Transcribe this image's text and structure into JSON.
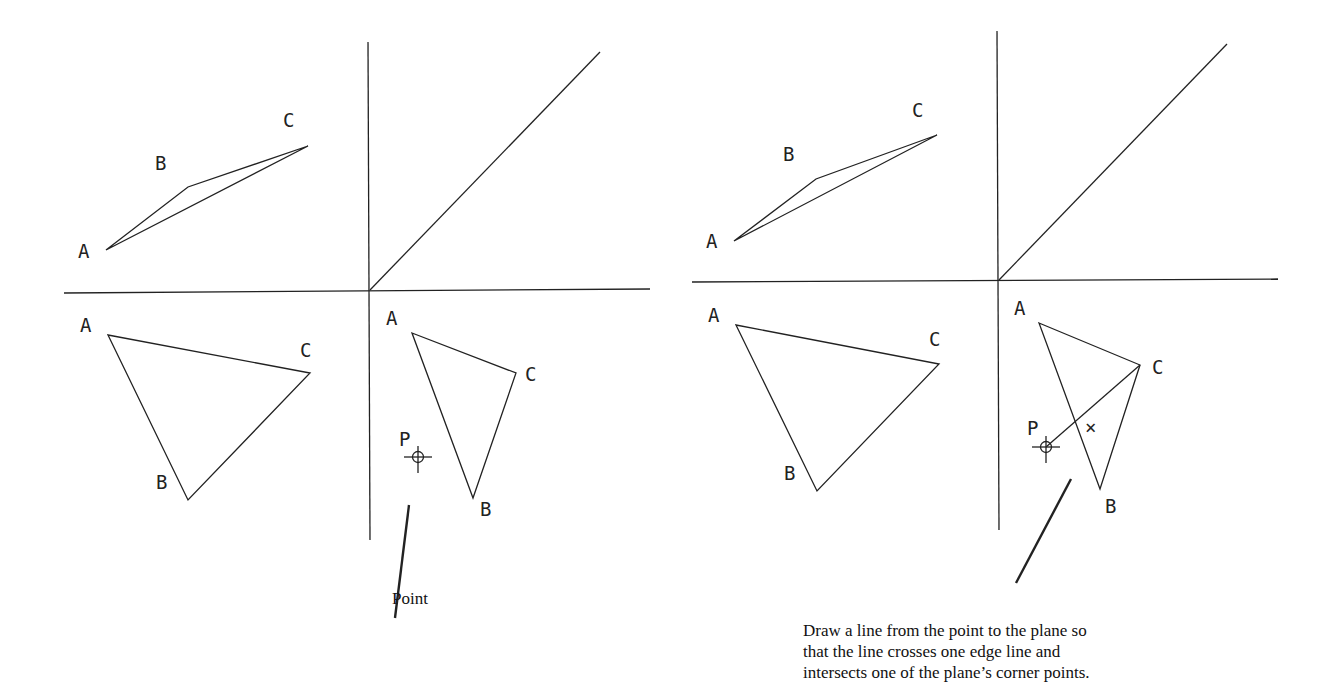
{
  "left_panel": {
    "caption": "Point",
    "labels": {
      "top_A": "A",
      "top_B": "B",
      "top_C": "C",
      "front_A": "A",
      "front_B": "B",
      "front_C": "C",
      "side_A": "A",
      "side_B": "B",
      "side_C": "C",
      "point": "P"
    }
  },
  "right_panel": {
    "caption_lines": [
      "Draw a line from the point to the plane so",
      "that the line crosses one edge line and",
      "intersects one of the plane’s corner points."
    ],
    "labels": {
      "top_A": "A",
      "top_B": "B",
      "top_C": "C",
      "front_A": "A",
      "front_B": "B",
      "front_C": "C",
      "side_A": "A",
      "side_B": "B",
      "side_C": "C",
      "point": "P",
      "intersection_mark": "×"
    }
  }
}
